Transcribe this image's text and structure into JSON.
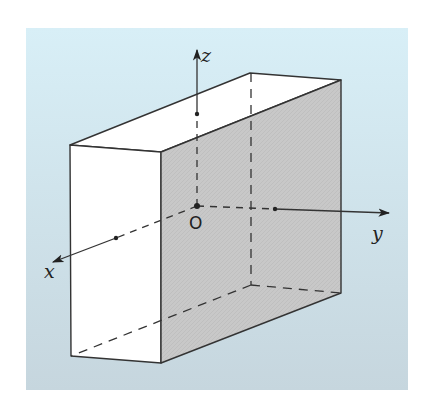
{
  "diagram": {
    "type": "3d-coordinate-box",
    "background": {
      "top_color": "#d6eef6",
      "bottom_color": "#c6d6de"
    },
    "colors": {
      "front_face": "#ffffff",
      "top_face": "#ffffff",
      "side_face": "#c9c9c9",
      "edge": "#333333"
    },
    "labels": {
      "z": "z",
      "y": "y",
      "x": "x",
      "origin": "O"
    }
  }
}
